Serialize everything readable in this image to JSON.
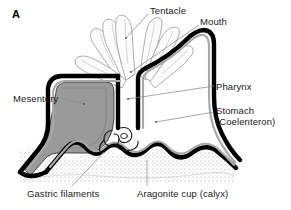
{
  "figure": {
    "panel_letter": "A",
    "background_color": "#ffffff",
    "ink_color": "#000000",
    "mesentery_fill": "#9a9a9a",
    "skeleton_stipple_color": "#b5b5b5",
    "tentacle_outline_color": "#8c8c8c",
    "leader_line_color": "#8a8a8a"
  },
  "labels": {
    "tentacle": "Tentacle",
    "mouth": "Mouth",
    "pharynx": "Pharynx",
    "stomach_line1": "Stomach",
    "stomach_line2": "(Coelenteron)",
    "mesentery": "Mesentery",
    "gastric_filaments": "Gastric filaments",
    "aragonite_cup": "Aragonite cup (calyx)"
  },
  "structures": [
    {
      "name": "tentacle",
      "description": "finger-like projections radiating from oral disc",
      "count": 7
    },
    {
      "name": "mouth",
      "description": "central opening at top of pharynx"
    },
    {
      "name": "pharynx",
      "description": "vertical tube descending from mouth"
    },
    {
      "name": "stomach",
      "description": "coelenteron, internal gastric cavity"
    },
    {
      "name": "mesentery",
      "description": "gray-filled vertical tissue partition"
    },
    {
      "name": "gastric-filaments",
      "description": "coiled filament at base of mesentery"
    },
    {
      "name": "aragonite-cup",
      "description": "stippled calcium carbonate skeleton calyx"
    }
  ]
}
